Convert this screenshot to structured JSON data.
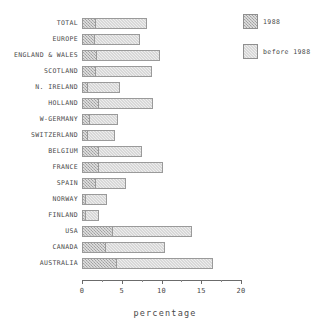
{
  "chart_data": {
    "type": "bar",
    "orientation": "horizontal",
    "stacked": true,
    "title": "",
    "xlabel": "percentage",
    "ylabel": "",
    "xlim": [
      0,
      20
    ],
    "xticks": [
      0,
      5,
      10,
      15,
      20
    ],
    "xtick_labels": [
      "0",
      "5",
      "10",
      "15",
      "20"
    ],
    "grid": false,
    "legend_position": "top-right",
    "categories": [
      "TOTAL",
      "EUROPE",
      "ENGLAND & WALES",
      "SCOTLAND",
      "N. IRELAND",
      "HOLLAND",
      "W-GERMANY",
      "SWITZERLAND",
      "BELGIUM",
      "FRANCE",
      "SPAIN",
      "NORWAY",
      "FINLAND",
      "USA",
      "CANADA",
      "AUSTRALIA"
    ],
    "series": [
      {
        "name": "1988",
        "color": "#b7b7b7",
        "values": [
          1.8,
          1.6,
          1.9,
          1.8,
          0.8,
          2.2,
          1.0,
          0.8,
          2.1,
          2.2,
          1.7,
          0.5,
          0.5,
          3.9,
          3.0,
          4.4
        ]
      },
      {
        "name": "before 1988",
        "color": "#eeeeee",
        "values": [
          6.4,
          5.7,
          7.9,
          7.0,
          4.0,
          6.7,
          3.5,
          3.3,
          5.5,
          8.0,
          3.8,
          2.7,
          1.7,
          9.9,
          7.4,
          12.1
        ]
      }
    ],
    "totals": [
      8.2,
      7.3,
      9.8,
      8.8,
      4.8,
      8.9,
      4.5,
      4.1,
      7.6,
      10.2,
      5.5,
      3.2,
      2.2,
      13.8,
      10.4,
      16.5
    ]
  },
  "legend": {
    "items": [
      {
        "label": "1988",
        "swatch": "hatched-dark"
      },
      {
        "label": "before 1988",
        "swatch": "hatched-light"
      }
    ]
  }
}
